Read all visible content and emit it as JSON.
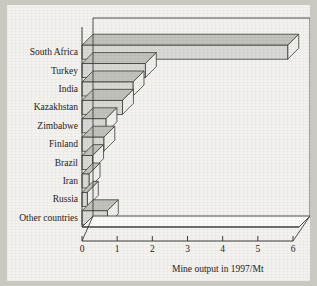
{
  "figure": {
    "background_color": "#f3f2ee",
    "page_color": "#c9c9c2",
    "bar_face_color": "#d6d6d2",
    "bar_top_color": "#b9b9b4",
    "bar_side_color": "#ececeа",
    "axis_color": "#3a3a36"
  },
  "chart_data": {
    "type": "bar",
    "orientation": "horizontal",
    "style": "3d",
    "title": "",
    "subtitle": "",
    "xlabel": "Mine output in 1997/Mt",
    "ylabel": "",
    "categories": [
      "South Africa",
      "Turkey",
      "India",
      "Kazakhstan",
      "Zimbabwe",
      "Finland",
      "Brazil",
      "Iran",
      "Russia",
      "Other countries"
    ],
    "values": [
      5.85,
      1.8,
      1.45,
      1.15,
      0.68,
      0.62,
      0.3,
      0.2,
      0.15,
      0.72
    ],
    "xlim": [
      0,
      6
    ],
    "xticks": [
      0,
      1,
      2,
      3,
      4,
      5,
      6
    ],
    "xtick_labels": [
      "0",
      "1",
      "2",
      "3",
      "4",
      "5",
      "6"
    ],
    "grid": false,
    "legend": null
  }
}
